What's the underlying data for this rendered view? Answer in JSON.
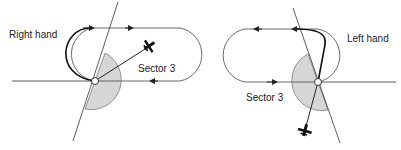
{
  "left_diagram": {
    "label": "Right hand",
    "sector_label": "Sector 3"
  },
  "right_diagram": {
    "label": "Left hand",
    "sector_label": "Sector 3"
  },
  "colors": {
    "line": "#333333",
    "sector_fill": "#d6d6d6",
    "background": "#ffffff"
  }
}
